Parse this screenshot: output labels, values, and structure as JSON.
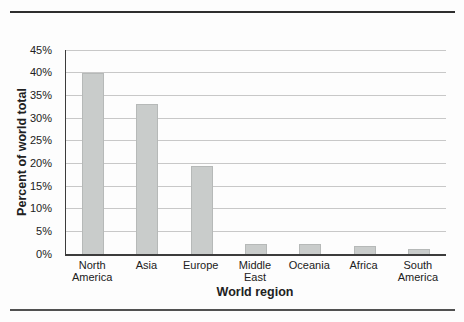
{
  "figure": {
    "background": "#fdfdfd"
  },
  "rules": {
    "top_color": "#2e2e2e",
    "bottom_color": "#515151"
  },
  "chart_data": {
    "type": "bar",
    "title": "",
    "xlabel": "World region",
    "ylabel": "Percent of world total",
    "categories": [
      "North\nAmerica",
      "Asia",
      "Europe",
      "Middle\nEast",
      "Oceania",
      "Africa",
      "South\nAmerica"
    ],
    "values": [
      40,
      33,
      19.5,
      2.2,
      2.2,
      1.8,
      1.2
    ],
    "ylim": [
      0,
      45
    ],
    "yticks": [
      0,
      5,
      10,
      15,
      20,
      25,
      30,
      35,
      40,
      45
    ],
    "ytick_suffix": "%",
    "grid": true,
    "legend": "none",
    "bar_color": "#c9cccb",
    "bar_border_color": "#b6b9b8",
    "gridline_color": "#c8c8c8",
    "axis_color": "#3c3c3c",
    "text_color": "#212121"
  }
}
